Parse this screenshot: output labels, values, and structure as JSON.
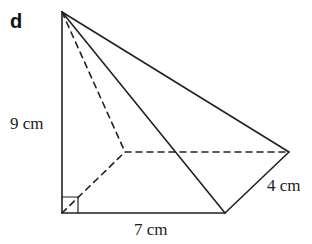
{
  "part_label": "d",
  "labels": {
    "height": "9 cm",
    "base_length": "7 cm",
    "base_width": "4 cm"
  },
  "colors": {
    "stroke": "#222222",
    "background": "#ffffff"
  }
}
